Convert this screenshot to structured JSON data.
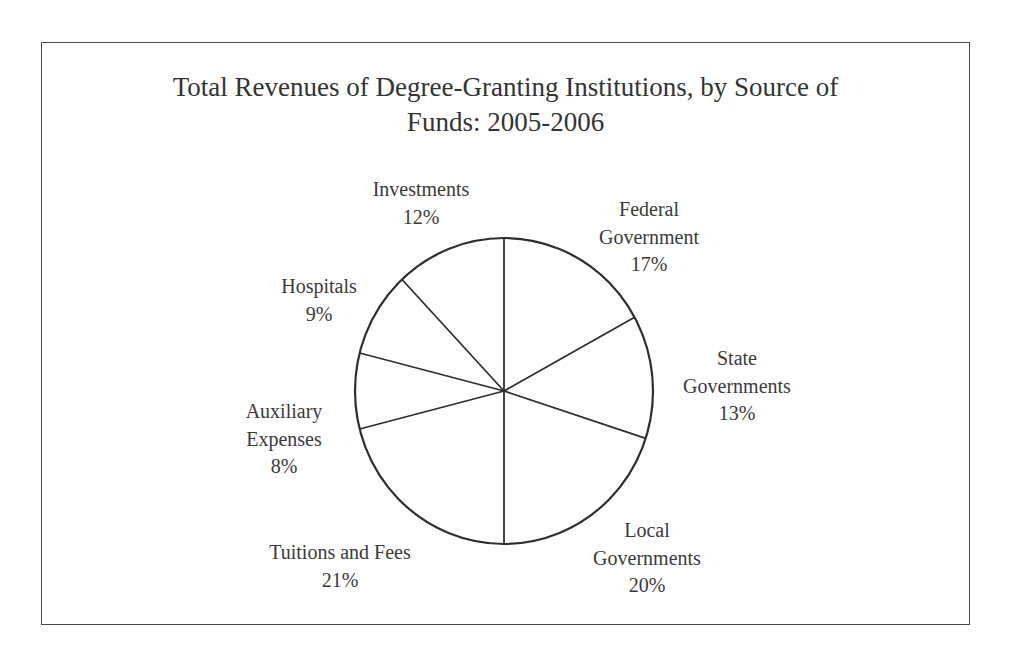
{
  "chart_data": {
    "type": "pie",
    "title": "Total Revenues of Degree-Granting Institutions, by Source of Funds:  2005-2006",
    "title_lines": [
      "Total Revenues of Degree-Granting Institutions, by Source of",
      "Funds:  2005-2006"
    ],
    "categories": [
      "Federal Government",
      "State Governments",
      "Local Governments",
      "Tuitions and Fees",
      "Auxiliary Expenses",
      "Hospitals",
      "Investments"
    ],
    "values": [
      17,
      13,
      20,
      21,
      8,
      9,
      12
    ],
    "unit": "%",
    "start_angle_deg": 0,
    "direction": "clockwise",
    "fill": "#ffffff",
    "stroke": "#333333",
    "legend": "none (labels placed outside slices)",
    "labels": [
      {
        "lines": [
          "Federal",
          "Government"
        ],
        "value": "17%"
      },
      {
        "lines": [
          "State",
          "Governments"
        ],
        "value": "13%"
      },
      {
        "lines": [
          "Local",
          "Governments"
        ],
        "value": "20%"
      },
      {
        "lines": [
          "Tuitions and Fees"
        ],
        "value": "21%"
      },
      {
        "lines": [
          "Auxiliary",
          "Expenses"
        ],
        "value": "8%"
      },
      {
        "lines": [
          "Hospitals"
        ],
        "value": "9%"
      },
      {
        "lines": [
          "Investments"
        ],
        "value": "12%"
      }
    ]
  }
}
